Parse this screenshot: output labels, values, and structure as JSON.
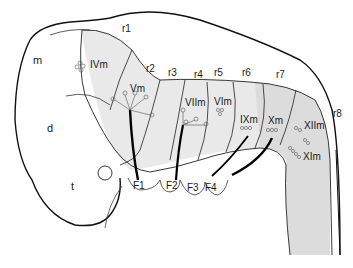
{
  "figure": {
    "colors": {
      "outline": "#111111",
      "fill_light": "#ececec",
      "fill_mid": "#dedede",
      "nerve": "#000000",
      "text": "#1a1a1a"
    }
  },
  "regions": {
    "m": "m",
    "d": "d",
    "t": "t"
  },
  "rhombomeres": {
    "r1": "r1",
    "r2": "r2",
    "r3": "r3",
    "r4": "r4",
    "r5": "r5",
    "r6": "r6",
    "r7": "r7",
    "r8": "r8"
  },
  "motor_nuclei": {
    "IVm": "IVm",
    "Vm": "Vm",
    "VIIm": "VIIm",
    "VIm": "VIm",
    "IXm": "IXm",
    "Xm": "Xm",
    "XIIm": "XIIm",
    "XIm": "XIm"
  },
  "facial_placodes": {
    "F1": "F1",
    "F2": "F2",
    "F3": "F3",
    "F4": "F4"
  }
}
